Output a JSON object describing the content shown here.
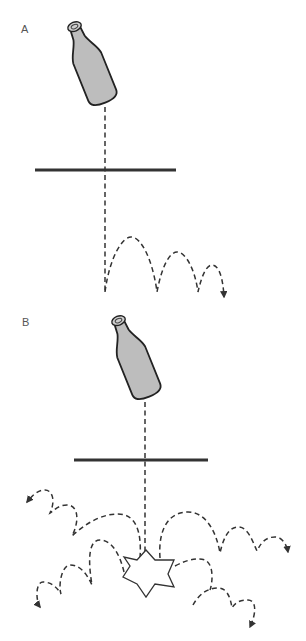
{
  "figure": {
    "panels": [
      {
        "id": "A",
        "label": "A",
        "description": "Bottle falls through surface and bounces with decreasing arcs",
        "surface_line": {
          "x1": 35,
          "x2": 176,
          "y": 170
        },
        "drop_x": 105,
        "bounces": 3,
        "outcome": "bounce"
      },
      {
        "id": "B",
        "label": "B",
        "description": "Bottle falls through surface and shatters; fragments bounce outward",
        "surface_line": {
          "x1": 74,
          "x2": 208,
          "y": 460
        },
        "drop_x": 145,
        "fragment_paths": 4,
        "outcome": "shatter"
      }
    ],
    "colors": {
      "line": "#333333",
      "bottle_fill": "#bdbdbd",
      "bottle_outline": "#222222",
      "label": "#555555",
      "background": "#ffffff"
    }
  }
}
